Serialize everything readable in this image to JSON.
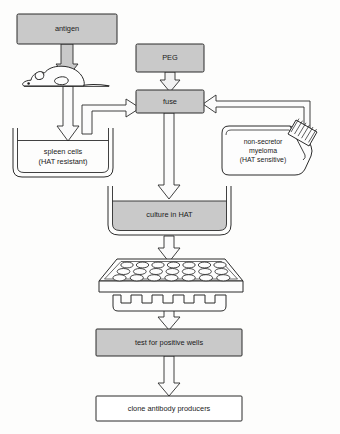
{
  "diagram": {
    "colors": {
      "box_fill": "#c9c9c9",
      "box_fill_light": "#d2d2d2",
      "outline": "#2b2b2b",
      "arrow_fill": "#f2f2f2",
      "background": "#fdfdfc",
      "white_box_fill": "#ffffff"
    },
    "nodes": {
      "antigen": {
        "label": "antigen"
      },
      "peg": {
        "label": "PEG"
      },
      "fuse": {
        "label": "fuse"
      },
      "spleen": {
        "line1": "spleen cells",
        "line2": "(HAT resistant)"
      },
      "myeloma": {
        "line1": "non-secretor",
        "line2": "myeloma",
        "line3": "(HAT  sensitive)"
      },
      "culture": {
        "label": "culture in HAT"
      },
      "test_wells": {
        "label": "test for positive wells"
      },
      "clone": {
        "label": "clone antibody producers"
      },
      "mouse": {
        "label": "mouse"
      },
      "plate": {
        "label": "microtiter-plate",
        "rows": 3,
        "columns": 7
      },
      "pipette": {
        "label": "multichannel-comb",
        "prongs": 6
      }
    },
    "flow_steps": [
      "antigen",
      "mouse",
      "spleen cells (HAT resistant)",
      "fuse",
      "culture in HAT",
      "microtiter plate",
      "test for positive wells",
      "clone antibody producers"
    ],
    "arrows": [
      {
        "name": "antigen-to-mouse",
        "from": "antigen",
        "to": "mouse"
      },
      {
        "name": "mouse-to-spleen",
        "from": "mouse",
        "to": "spleen"
      },
      {
        "name": "spleen-to-fuse",
        "from": "spleen",
        "to": "fuse"
      },
      {
        "name": "peg-to-fuse",
        "from": "peg",
        "to": "fuse"
      },
      {
        "name": "myeloma-to-fuse",
        "from": "myeloma",
        "to": "fuse"
      },
      {
        "name": "fuse-to-culture",
        "from": "fuse",
        "to": "culture"
      },
      {
        "name": "culture-to-plate",
        "from": "culture",
        "to": "plate"
      },
      {
        "name": "pipette-to-test",
        "from": "pipette",
        "to": "test_wells"
      },
      {
        "name": "test-to-clone",
        "from": "test_wells",
        "to": "clone"
      }
    ]
  }
}
